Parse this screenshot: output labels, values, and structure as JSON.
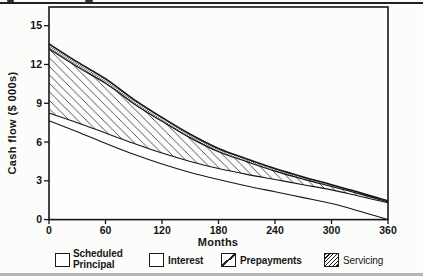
{
  "page": {
    "background": "#fcfcfb",
    "top_rule_color": "#222222",
    "bottom_rule_color": "#b0b7b5"
  },
  "chart_data": {
    "type": "area",
    "stacked": true,
    "title": "",
    "xlabel": "Months",
    "ylabel": "Cash flow ($ 000s)",
    "xlim": [
      0,
      360
    ],
    "ylim": [
      0,
      15
    ],
    "x_ticks": [
      0,
      60,
      120,
      180,
      240,
      300,
      360
    ],
    "y_ticks": [
      0,
      3,
      6,
      9,
      12,
      15
    ],
    "grid": false,
    "legend_position": "bottom",
    "months": [
      0,
      30,
      60,
      90,
      120,
      150,
      180,
      210,
      240,
      270,
      300,
      330,
      360
    ],
    "series": [
      {
        "name": "Interest",
        "fill": "white",
        "values": [
          7.65,
          6.8,
          5.9,
          5.05,
          4.3,
          3.65,
          3.1,
          2.6,
          2.15,
          1.7,
          1.25,
          0.65,
          0
        ]
      },
      {
        "name": "Scheduled Principal",
        "fill": "white",
        "values": [
          0.6,
          0.7,
          0.8,
          0.85,
          0.85,
          0.85,
          0.85,
          0.9,
          0.95,
          1.0,
          1.05,
          1.15,
          1.3
        ]
      },
      {
        "name": "Prepayments",
        "fill": "hatch",
        "values": [
          4.95,
          4.32,
          3.84,
          3.07,
          2.45,
          1.82,
          1.3,
          0.98,
          0.65,
          0.43,
          0.26,
          0.19,
          0.07
        ]
      },
      {
        "name": "Servicing",
        "fill": "dense",
        "values": [
          0.4,
          0.38,
          0.36,
          0.33,
          0.3,
          0.28,
          0.25,
          0.22,
          0.2,
          0.17,
          0.14,
          0.11,
          0.08
        ]
      }
    ],
    "colors": {
      "line": "#161616",
      "hatch_line": "#3a3a3a",
      "dense_line": "#141414",
      "area_white": "#fefefe"
    }
  },
  "legend": {
    "items": [
      {
        "label": "Scheduled Principal",
        "swatch": "plain"
      },
      {
        "label": "Interest",
        "swatch": "plain"
      },
      {
        "label": "Prepayments",
        "swatch": "hatch"
      },
      {
        "label": "Servicing",
        "swatch": "dense"
      }
    ]
  }
}
